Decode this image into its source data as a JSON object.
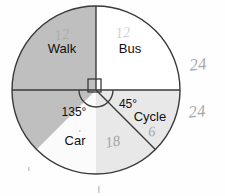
{
  "figure": {
    "type": "pie-chart-diagram",
    "title": "",
    "center": {
      "x": 96,
      "y": 90
    },
    "radius": 84,
    "outline_color": "#3a3a3a"
  },
  "chart_data": {
    "type": "pie",
    "title": "",
    "xlabel": "",
    "ylabel": "",
    "categories": [
      "Walk",
      "Bus",
      "Car",
      "Cycle"
    ],
    "values": [
      90,
      90,
      135,
      45
    ],
    "unit": "degrees",
    "labels_shown": [
      "Walk",
      "Bus",
      "Car",
      "Cycle"
    ],
    "angle_labels_shown": [
      "135°",
      "45°"
    ],
    "legend_position": "none",
    "grid": false,
    "slices": [
      {
        "name": "Walk",
        "angle": 90,
        "start_deg": 270,
        "end_deg": 360,
        "color": "#ffffff",
        "label": "Walk",
        "label_x": 62,
        "label_y": 50,
        "angle_label": ""
      },
      {
        "name": "Bus",
        "angle": 90,
        "start_deg": 0,
        "end_deg": 90,
        "color": "#e8e8e8",
        "label": "Bus",
        "label_x": 130,
        "label_y": 50,
        "angle_label": ""
      },
      {
        "name": "Cycle",
        "angle": 45,
        "start_deg": 90,
        "end_deg": 135,
        "color": "#fbfbfb",
        "label": "Cycle",
        "label_x": 150,
        "label_y": 118,
        "angle_label": "45°"
      },
      {
        "name": "Car",
        "angle": 135,
        "start_deg": 135,
        "end_deg": 270,
        "color": "#bfbfbf",
        "label": "Car",
        "label_x": 75,
        "label_y": 142,
        "angle_label": "135°"
      }
    ]
  },
  "annotations": {
    "angle_135": {
      "text": "135°",
      "x": 74,
      "y": 113
    },
    "angle_45": {
      "text": "45°",
      "x": 128,
      "y": 105
    },
    "right_angle_marker": {
      "name": "right-angle-square",
      "x": 88,
      "y": 79,
      "size": 13
    },
    "protractor_arc": {
      "name": "angle-arc",
      "cx": 96,
      "cy": 90,
      "r": 17
    }
  },
  "handwriting": [
    {
      "id": "hw-walk-12",
      "text": "12",
      "x": 62,
      "y": 36,
      "size": 15,
      "rotate": -8,
      "faint": true
    },
    {
      "id": "hw-bus-12",
      "text": "12",
      "x": 123,
      "y": 34,
      "size": 15,
      "rotate": -6,
      "faint": true
    },
    {
      "id": "hw-car-18",
      "text": "18",
      "x": 113,
      "y": 143,
      "size": 15,
      "rotate": -10,
      "faint": false
    },
    {
      "id": "hw-cycle-6",
      "text": "6",
      "x": 152,
      "y": 133,
      "size": 14,
      "rotate": -6,
      "faint": false
    },
    {
      "id": "hw-right-24-top",
      "text": "24",
      "x": 198,
      "y": 66,
      "size": 17,
      "rotate": -6,
      "faint": false
    },
    {
      "id": "hw-right-24-bottom",
      "text": "24",
      "x": 197,
      "y": 113,
      "size": 17,
      "rotate": -6,
      "faint": false
    }
  ],
  "specks": [
    {
      "id": "speck-left",
      "x": 28,
      "y": 167,
      "w": 1.6,
      "h": 4
    },
    {
      "id": "speck-bottom",
      "x": 98,
      "y": 186,
      "w": 1.6,
      "h": 7
    },
    {
      "id": "speck-car",
      "x": 79,
      "y": 130,
      "w": 1.6,
      "h": 2
    }
  ]
}
